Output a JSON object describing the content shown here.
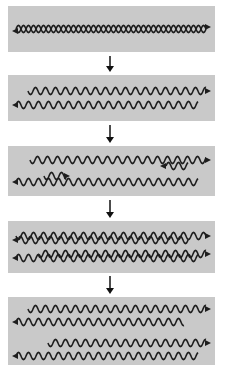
{
  "diagram": {
    "colors": {
      "panel_bg": "#c9c9c9",
      "strand": "#1e1e1e",
      "page_bg": "#ffffff"
    },
    "stages": [
      {
        "id": 1,
        "label": "Parental double-stranded DNA",
        "top": 6,
        "height": 46
      },
      {
        "id": 2,
        "label": "Strands separated",
        "top": 75,
        "height": 46
      },
      {
        "id": 3,
        "label": "Primers / new strand synthesis begins",
        "top": 146,
        "height": 50
      },
      {
        "id": 4,
        "label": "New complementary strands synthesized",
        "top": 221,
        "height": 52
      },
      {
        "id": 5,
        "label": "Two daughter DNA molecules",
        "top": 297,
        "height": 68
      }
    ],
    "arrows": [
      {
        "top": 56,
        "height": 16
      },
      {
        "top": 125,
        "height": 18
      },
      {
        "top": 200,
        "height": 18
      },
      {
        "top": 276,
        "height": 18
      }
    ]
  }
}
